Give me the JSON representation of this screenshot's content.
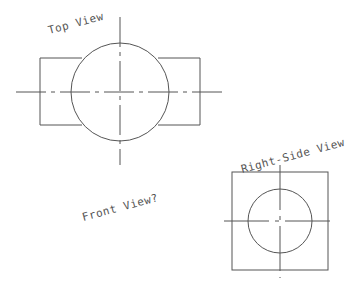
{
  "drawing": {
    "line_color": "#555555",
    "background": "#ffffff",
    "labels": {
      "top_view": "Top View",
      "front_view": "Front View?",
      "right_side_view": "Right-Side View"
    },
    "top_view": {
      "rect": {
        "x": 40,
        "y": 58,
        "width": 160,
        "height": 67
      },
      "circle": {
        "cx": 120,
        "cy": 92,
        "r": 49
      },
      "h_centerline": {
        "x1": 16,
        "x2": 223,
        "y": 92
      },
      "v_centerline": {
        "x": 120,
        "y1": 17,
        "y2": 165
      }
    },
    "right_side_view": {
      "rect": {
        "x": 232,
        "y": 172,
        "width": 96,
        "height": 98
      },
      "circle": {
        "cx": 280,
        "cy": 221,
        "r": 32
      },
      "h_centerline": {
        "x1": 224,
        "x2": 335,
        "y": 221
      },
      "v_centerline": {
        "x": 280,
        "y1": 165,
        "y2": 278
      }
    }
  }
}
